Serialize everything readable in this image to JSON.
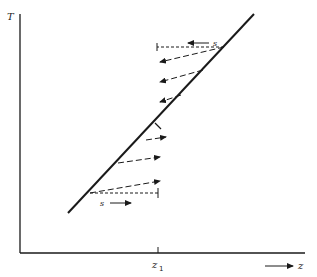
{
  "diagram": {
    "y_axis_label": "T",
    "x_axis_label": "z",
    "x_marker_label": "z",
    "x_marker_subscript": "1",
    "upper_flux_label": "s",
    "lower_flux_label": "s",
    "colors": {
      "ink": "#1a1a1a",
      "background": "#ffffff"
    },
    "main_line": {
      "x1": 68,
      "y1": 213,
      "x2": 254,
      "y2": 14
    },
    "upper_arrows": [
      {
        "from": [
          224,
          47
        ],
        "to": [
          160,
          62
        ]
      },
      {
        "from": [
          203,
          70
        ],
        "to": [
          160,
          82
        ]
      },
      {
        "from": [
          181,
          95
        ],
        "to": [
          160,
          102
        ]
      }
    ],
    "lower_arrows": [
      {
        "from": [
          146,
          140
        ],
        "to": [
          168,
          137
        ]
      },
      {
        "from": [
          118,
          163
        ],
        "to": [
          158,
          155
        ]
      },
      {
        "from": [
          90,
          193
        ],
        "to": [
          158,
          180
        ]
      }
    ]
  }
}
